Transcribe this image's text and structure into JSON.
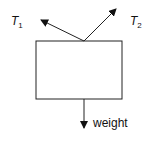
{
  "diagram": {
    "type": "free-body diagram",
    "forces": [
      {
        "id": "T1",
        "label": "T",
        "subscript": "1",
        "direction": "up-left"
      },
      {
        "id": "T2",
        "label": "T",
        "subscript": "2",
        "direction": "up-right"
      },
      {
        "id": "weight",
        "label": "weight",
        "direction": "down"
      }
    ],
    "colors": {
      "line": "#111111",
      "background": "#ffffff"
    }
  }
}
